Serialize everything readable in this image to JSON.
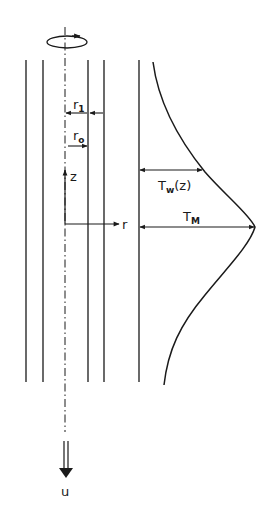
{
  "diagram": {
    "colors": {
      "ink": "#1a1a1a",
      "background": "#ffffff"
    },
    "labels": {
      "r1": {
        "main": "r",
        "sub": "1"
      },
      "r0": {
        "main": "r",
        "sub": "o"
      },
      "z": "z",
      "r": "r",
      "Tw": {
        "main": "T",
        "sub": "w",
        "suffix": "(z)"
      },
      "TM": {
        "main": "T",
        "sub": "M"
      },
      "u": "u"
    },
    "icons": {
      "rotation": "rotation-arrow-icon",
      "flow": "double-down-arrow-icon"
    }
  }
}
